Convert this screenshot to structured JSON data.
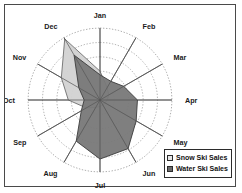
{
  "chart_data": {
    "type": "radar",
    "title": "",
    "xlabel": "",
    "ylabel": "",
    "categories": [
      "Jan",
      "Feb",
      "Mar",
      "Apr",
      "May",
      "Jun",
      "Jul",
      "Aug",
      "Sep",
      "Oct",
      "Nov",
      "Dec"
    ],
    "rings": 5,
    "rmax": 100,
    "grid": true,
    "legend_position": "bottom-right",
    "series": [
      {
        "name": "Snow Ski Sales",
        "color": "#d2d2d2",
        "stroke": "#6e6e6e",
        "values": [
          40,
          20,
          14,
          10,
          8,
          8,
          9,
          12,
          22,
          44,
          62,
          98
        ]
      },
      {
        "name": "Water Ski Sales",
        "color": "#787878",
        "stroke": "#3c3c3c",
        "values": [
          35,
          30,
          38,
          52,
          58,
          78,
          82,
          66,
          30,
          22,
          34,
          72
        ]
      }
    ]
  },
  "axis_labels": {
    "jan": "Jan",
    "feb": "Feb",
    "mar": "Mar",
    "apr": "Apr",
    "may": "May",
    "jun": "Jun",
    "jul": "Jul",
    "aug": "Aug",
    "sep": "Sep",
    "oct": "Oct",
    "nov": "Nov",
    "dec": "Dec"
  },
  "legend": {
    "items": [
      {
        "label": "Snow Ski Sales",
        "swatch_color": "#e6e6e6"
      },
      {
        "label": "Water Ski Sales",
        "swatch_color": "#6b6b6b"
      }
    ]
  },
  "colors": {
    "frame_border": "#4a4a4a",
    "plot_background": "#ffffff",
    "grid_line": "#9a9a9a",
    "spoke_line": "#555555",
    "snow_fill": "#d2d2d2",
    "water_fill": "#787878",
    "label_text": "#1a1a1a"
  }
}
